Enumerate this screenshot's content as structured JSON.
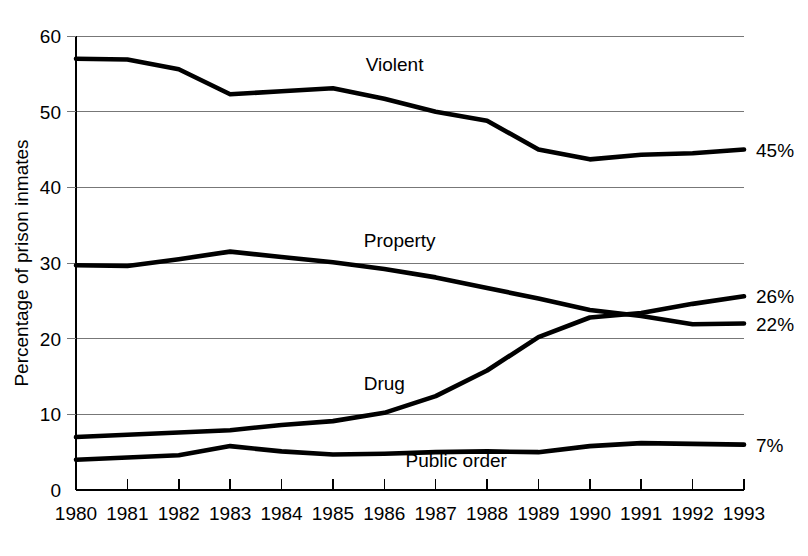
{
  "chart_data": {
    "type": "line",
    "title": "",
    "xlabel": "",
    "ylabel": "Percentage of prison inmates",
    "ylim": [
      0,
      60
    ],
    "yticks": [
      0,
      10,
      20,
      30,
      40,
      50,
      60
    ],
    "ytick_labels": [
      "0",
      "10",
      "20",
      "30",
      "40",
      "50",
      "60"
    ],
    "grid": true,
    "grid_axis": "y",
    "legend_position": "inline-labels",
    "categories": [
      "1980",
      "1981",
      "1982",
      "1983",
      "1984",
      "1985",
      "1986",
      "1987",
      "1988",
      "1989",
      "1990",
      "1991",
      "1992",
      "1993"
    ],
    "x": [
      1980,
      1981,
      1982,
      1983,
      1984,
      1985,
      1986,
      1987,
      1988,
      1989,
      1990,
      1991,
      1992,
      1993
    ],
    "series": [
      {
        "name": "Violent",
        "label": "Violent",
        "color": "#000000",
        "values": [
          57.0,
          56.9,
          55.6,
          52.3,
          52.7,
          53.1,
          51.7,
          50.0,
          48.8,
          45.0,
          43.7,
          44.3,
          44.5,
          45.0
        ],
        "end_label": "45%"
      },
      {
        "name": "Property",
        "label": "Property",
        "color": "#000000",
        "values": [
          29.7,
          29.6,
          30.5,
          31.5,
          30.8,
          30.1,
          29.2,
          28.1,
          26.7,
          25.3,
          23.8,
          23.0,
          21.9,
          22.0
        ],
        "end_label": "22%"
      },
      {
        "name": "Drug",
        "label": "Drug",
        "color": "#000000",
        "values": [
          7.0,
          7.3,
          7.6,
          7.9,
          8.6,
          9.1,
          10.2,
          12.4,
          15.8,
          20.2,
          22.8,
          23.4,
          24.6,
          25.6
        ],
        "end_label": "26%"
      },
      {
        "name": "Public order",
        "label": "Public order",
        "color": "#000000",
        "values": [
          4.0,
          4.3,
          4.6,
          5.8,
          5.1,
          4.7,
          4.8,
          5.0,
          5.1,
          5.0,
          5.8,
          6.2,
          6.1,
          6.0
        ],
        "end_label": "7%"
      }
    ],
    "series_label_positions": [
      {
        "name": "Violent",
        "x_year": 1986.2,
        "y_value": 55.4
      },
      {
        "name": "Property",
        "x_year": 1986.3,
        "y_value": 32.1
      },
      {
        "name": "Drug",
        "x_year": 1986.0,
        "y_value": 13.2
      },
      {
        "name": "Public order",
        "x_year": 1987.4,
        "y_value": 3.0
      }
    ]
  }
}
